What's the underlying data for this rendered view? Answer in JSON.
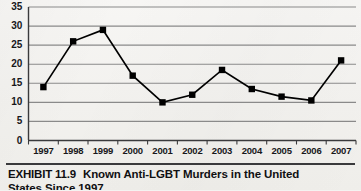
{
  "chart_data": {
    "type": "line",
    "title": "",
    "xlabel": "",
    "ylabel": "",
    "categories": [
      "1997",
      "1998",
      "1999",
      "2000",
      "2001",
      "2002",
      "2003",
      "2004",
      "2005",
      "2006",
      "2007"
    ],
    "values": [
      14,
      26,
      29,
      17,
      10,
      12,
      18.5,
      13.5,
      11.5,
      10.5,
      21
    ],
    "ylim": [
      0,
      35
    ],
    "ytick_values": [
      0,
      5,
      10,
      15,
      20,
      25,
      30,
      35
    ],
    "ytick_labels": [
      "0",
      "5",
      "10",
      "15",
      "20",
      "25",
      "30",
      "35"
    ],
    "grid": true,
    "grid_axis": "y",
    "legend": false,
    "legend_position": "none",
    "marker": "square",
    "series_color": "#000000",
    "grid_color": "#8a8a8a",
    "axis_color": "#3a3a3c",
    "background_color": "#f4f3f1"
  },
  "caption": {
    "exhibit_label": "EXHIBIT 11.9",
    "title_line1": "Known Anti-LGBT Murders in the United",
    "title_line2": "States Since 1997"
  }
}
